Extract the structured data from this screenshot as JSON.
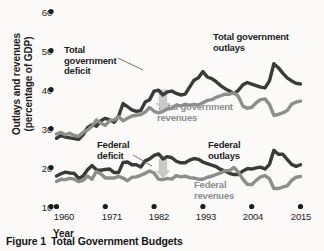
{
  "caption": {
    "prefix": "Figure 1",
    "title": "Total Government Budgets"
  },
  "colors": {
    "outlays": "#3a3a3a",
    "revenues": "#8d8d8d",
    "arrow": "#c9c9c9",
    "text": "#1c1c1c",
    "background": "#fbfaf8"
  },
  "annotations": {
    "total_deficit": "Total\ngovernment\ndeficit",
    "total_outlays": "Total government\noutlays",
    "total_revenues": "Total government\nrevenues",
    "federal_deficit": "Federal\ndeficit",
    "federal_outlays": "Federal\noutlays",
    "federal_revenues": "Federal\nrevenues"
  },
  "chart_data": {
    "type": "line",
    "title": "Total Government Budgets",
    "xlabel": "Year",
    "ylabel": "Outlays and revenues (percentage of GDP)",
    "xlim": [
      1960,
      2015
    ],
    "ylim": [
      10,
      60
    ],
    "xticks": [
      1960,
      1971,
      1982,
      1993,
      2004,
      2015
    ],
    "yticks": [
      10,
      20,
      30,
      40,
      50,
      60
    ],
    "grid": false,
    "legend": "annotated-inline",
    "x": [
      1960,
      1961,
      1962,
      1963,
      1964,
      1965,
      1966,
      1967,
      1968,
      1969,
      1970,
      1971,
      1972,
      1973,
      1974,
      1975,
      1976,
      1977,
      1978,
      1979,
      1980,
      1981,
      1982,
      1983,
      1984,
      1985,
      1986,
      1987,
      1988,
      1989,
      1990,
      1991,
      1992,
      1993,
      1994,
      1995,
      1996,
      1997,
      1998,
      1999,
      2000,
      2001,
      2002,
      2003,
      2004,
      2005,
      2006,
      2007,
      2008,
      2009,
      2010,
      2011,
      2012,
      2013,
      2014,
      2015
    ],
    "series": [
      {
        "name": "Total government outlays",
        "color": "#3a3a3a",
        "values": [
          27.5,
          28.2,
          27.8,
          27.6,
          27.4,
          27.2,
          28.4,
          30.2,
          31.0,
          30.6,
          32.0,
          32.6,
          32.2,
          31.6,
          33.2,
          36.4,
          35.6,
          34.8,
          34.4,
          34.6,
          36.8,
          37.4,
          39.6,
          39.8,
          38.6,
          39.4,
          39.6,
          39.0,
          38.6,
          38.8,
          40.6,
          42.4,
          43.0,
          44.6,
          43.2,
          42.8,
          42.0,
          41.0,
          40.2,
          39.6,
          39.0,
          39.8,
          41.2,
          41.8,
          41.4,
          41.0,
          40.6,
          40.4,
          42.2,
          46.6,
          45.6,
          44.2,
          43.0,
          42.2,
          41.6,
          41.4
        ]
      },
      {
        "name": "Total government revenues",
        "color": "#8d8d8d",
        "values": [
          28.6,
          29.0,
          28.4,
          28.8,
          28.2,
          28.0,
          29.0,
          29.6,
          30.6,
          32.2,
          31.4,
          30.8,
          32.0,
          32.2,
          33.0,
          32.0,
          32.6,
          33.2,
          33.4,
          33.6,
          34.2,
          35.4,
          34.4,
          34.0,
          34.4,
          35.0,
          35.2,
          36.0,
          35.8,
          36.2,
          36.0,
          36.2,
          36.0,
          36.6,
          37.2,
          37.4,
          38.0,
          38.4,
          38.8,
          38.8,
          39.2,
          38.2,
          35.8,
          35.2,
          35.4,
          36.6,
          37.4,
          37.6,
          36.2,
          33.4,
          33.6,
          34.0,
          34.6,
          36.2,
          36.8,
          37.0
        ]
      },
      {
        "name": "Federal outlays",
        "color": "#3a3a3a",
        "values": [
          17.8,
          18.4,
          18.8,
          18.6,
          18.5,
          17.2,
          17.8,
          19.4,
          20.5,
          19.4,
          19.3,
          19.5,
          19.6,
          18.7,
          18.7,
          21.3,
          21.4,
          20.7,
          20.7,
          20.1,
          21.7,
          22.2,
          23.1,
          23.5,
          22.2,
          22.8,
          22.5,
          21.6,
          21.2,
          21.2,
          21.9,
          22.3,
          22.1,
          21.4,
          21.0,
          20.6,
          20.2,
          19.5,
          19.1,
          18.5,
          18.2,
          18.2,
          19.1,
          19.7,
          19.6,
          19.9,
          20.1,
          19.6,
          20.8,
          24.4,
          23.4,
          23.4,
          22.1,
          20.8,
          20.3,
          20.7
        ]
      },
      {
        "name": "Federal revenues",
        "color": "#8d8d8d",
        "values": [
          16.4,
          17.0,
          16.9,
          17.2,
          17.0,
          16.4,
          16.7,
          17.8,
          17.0,
          19.0,
          18.4,
          17.3,
          17.3,
          17.3,
          17.7,
          17.3,
          16.6,
          17.5,
          17.6,
          18.0,
          18.5,
          19.1,
          18.6,
          17.0,
          16.9,
          17.2,
          17.0,
          17.9,
          17.6,
          17.8,
          17.4,
          17.3,
          17.0,
          17.0,
          17.5,
          17.8,
          18.2,
          18.6,
          19.2,
          19.2,
          20.0,
          18.8,
          17.0,
          15.7,
          15.6,
          16.7,
          17.6,
          17.9,
          17.1,
          14.6,
          14.6,
          15.0,
          15.3,
          16.7,
          17.5,
          17.7
        ]
      }
    ],
    "deficit_arrows": [
      {
        "name": "total-government-deficit-arrow",
        "year": 1984,
        "from": 40.0,
        "to": 34.5
      },
      {
        "name": "federal-deficit-arrow",
        "year": 1984,
        "from": 22.2,
        "to": 17.2
      }
    ]
  }
}
